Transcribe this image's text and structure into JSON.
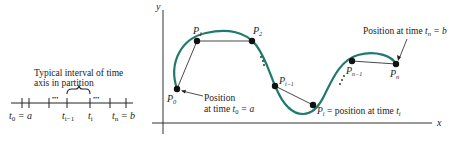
{
  "colors": {
    "curve": "#1f7a6a",
    "ink": "#222222",
    "background": "#ffffff"
  },
  "partition": {
    "caption_line1": "Typical interval of time",
    "caption_line2": "axis in partition",
    "dots": "•••",
    "labels": {
      "t0_var": "t",
      "t0_sub": "0",
      "t0_eq": " = a",
      "tim1_var": "t",
      "tim1_sub": "i−1",
      "ti_var": "t",
      "ti_sub": "i",
      "tn_var": "t",
      "tn_sub": "n",
      "tn_eq": " = b"
    }
  },
  "graph": {
    "y_axis_label": "y",
    "x_axis_label": "x",
    "points": [
      {
        "name": "P",
        "sub": "0",
        "x": 177,
        "y": 89
      },
      {
        "name": "P",
        "sub": "1",
        "x": 197,
        "y": 41
      },
      {
        "name": "P",
        "sub": "2",
        "x": 252,
        "y": 41
      },
      {
        "name": "P",
        "sub": "i−1",
        "x": 275,
        "y": 86
      },
      {
        "name": "P",
        "sub": "i",
        "x": 313,
        "y": 105
      },
      {
        "name": "P",
        "sub": "n−1",
        "x": 352,
        "y": 61
      },
      {
        "name": "P",
        "sub": "n",
        "x": 396,
        "y": 64
      }
    ],
    "annotations": {
      "start_line1": "Position",
      "start_line2": "at time ",
      "start_var": "t",
      "start_sub": "0",
      "start_eq": " = a",
      "pi_lhs": "P",
      "pi_lhs_sub": "i",
      "pi_text": " = position at time ",
      "pi_var": "t",
      "pi_sub": "i",
      "end_text": "Position at time ",
      "end_var": "t",
      "end_sub": "n",
      "end_eq": " = b"
    }
  }
}
